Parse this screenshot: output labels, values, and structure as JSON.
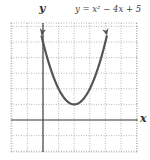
{
  "chart_data": {
    "type": "line",
    "title": "y = x² − 4x + 5",
    "xlabel": "x",
    "ylabel": "y",
    "xlim": [
      -2,
      6
    ],
    "ylim": [
      -2,
      6.3
    ],
    "grid": true,
    "grid_style": "dotted",
    "legend": null,
    "series": [
      {
        "name": "y = x² − 4x + 5",
        "function": "x^2 - 4x + 5",
        "vertex": [
          2,
          1
        ],
        "x": [
          -0.2,
          0,
          0.5,
          1,
          1.5,
          2,
          2.5,
          3,
          3.5,
          4,
          4.2
        ],
        "y": [
          5.84,
          5,
          3.25,
          2,
          1.25,
          1,
          1.25,
          2,
          3.25,
          5,
          5.84
        ],
        "arrows_at_ends": true,
        "color": "#555555"
      }
    ]
  },
  "labels": {
    "y_axis": "y",
    "x_axis": "x",
    "equation": "y = x² − 4x + 5"
  }
}
